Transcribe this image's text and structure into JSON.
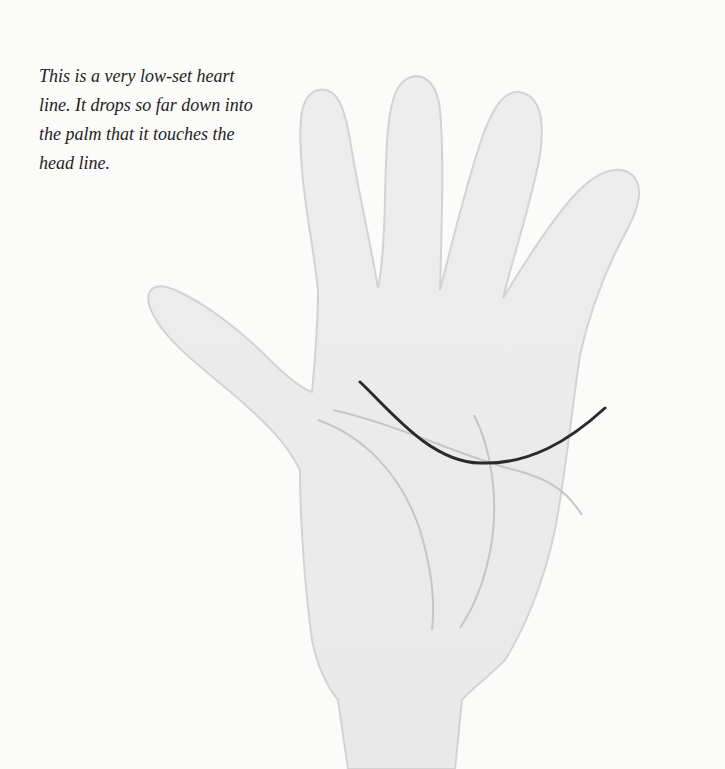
{
  "caption": {
    "text": "This is a very low-set heart line. It drops so far down into the palm that it touches the head line."
  },
  "illustration": {
    "subject": "open palm of a right hand",
    "highlighted_line": "heart line",
    "other_lines": [
      "head line",
      "life line",
      "fate line"
    ],
    "colors": {
      "background": "#fbfbfa",
      "hand_fill": "#ececec",
      "hand_edge": "#d2d2d2",
      "highlighted_line": "#2a2a2a",
      "other_lines": "#c6c6c6"
    }
  }
}
